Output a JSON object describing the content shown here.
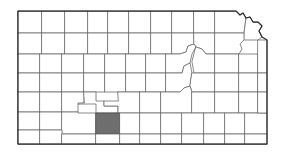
{
  "figure": {
    "kind": "choropleth-locator-map",
    "state": "Kansas",
    "background_color": "#ffffff",
    "county_fill_color": "#ffffff",
    "county_border_color": "#6b6b6b",
    "state_border_color": "#2b2b2b",
    "highlight_fill_color": "#6e6e6e",
    "highlight_border_color": "#4a4a4a",
    "highlighted_county_count": 1,
    "highlighted_county_region": "south-central",
    "caption": ""
  },
  "chart_data": {
    "type": "map",
    "subtitle": "",
    "xlabel": "",
    "ylabel": "",
    "legend": [],
    "grid": false,
    "projection": "plate-carree-approx",
    "viewbox": [
      0,
      0,
      286,
      156
    ],
    "state_outline_points": "18,11 18,144 267,144 267,40 262,37 259,31 262,26 258,22 253,22 250,17 246,18 243,13 240,15 236,11 18,11",
    "highlighted_feature": {
      "name": "highlighted-county",
      "value": 1,
      "fill": "#6e6e6e",
      "bbox": [
        96,
        113,
        24,
        21
      ]
    },
    "unhighlighted_value": 0,
    "counties": [
      {
        "id": "c-r1-01",
        "hl": false,
        "d": "M18,11 L42,11 L42,33 L18,33 Z"
      },
      {
        "id": "c-r1-02",
        "hl": false,
        "d": "M42,11 L65,11 L65,33 L42,33 Z"
      },
      {
        "id": "c-r1-03",
        "hl": false,
        "d": "M65,11 L88,11 L88,33 L65,33 Z"
      },
      {
        "id": "c-r1-04",
        "hl": false,
        "d": "M88,11 L108,11 L108,33 L88,33 Z"
      },
      {
        "id": "c-r1-05",
        "hl": false,
        "d": "M108,11 L129,11 L129,33 L108,33 Z"
      },
      {
        "id": "c-r1-06",
        "hl": false,
        "d": "M129,11 L151,11 L151,33 L129,33 Z"
      },
      {
        "id": "c-r1-07",
        "hl": false,
        "d": "M151,11 L172,11 L172,33 L151,33 Z"
      },
      {
        "id": "c-r1-08",
        "hl": false,
        "d": "M172,11 L194,11 L194,33 L172,33 Z"
      },
      {
        "id": "c-r1-09",
        "hl": false,
        "d": "M194,11 L215,11 L215,33 L194,33 Z"
      },
      {
        "id": "c-r1-10",
        "hl": false,
        "d": "M215,11 L236,11 L240,15 L243,13 L246,18 L244,33 L215,33 Z"
      },
      {
        "id": "c-r1-11",
        "hl": false,
        "d": "M244,33 L246,18 L250,17 L253,22 L258,22 L262,26 L259,31 L262,37 L258,40 L244,40 Z"
      },
      {
        "id": "c-r2-01",
        "hl": false,
        "d": "M18,33 L42,33 L42,54 L18,54 Z"
      },
      {
        "id": "c-r2-02",
        "hl": false,
        "d": "M42,33 L65,33 L65,54 L42,54 Z"
      },
      {
        "id": "c-r2-03",
        "hl": false,
        "d": "M65,33 L88,33 L88,54 L65,54 Z"
      },
      {
        "id": "c-r2-04",
        "hl": false,
        "d": "M88,33 L108,33 L108,54 L88,54 Z"
      },
      {
        "id": "c-r2-05",
        "hl": false,
        "d": "M108,33 L129,33 L129,54 L108,54 Z"
      },
      {
        "id": "c-r2-06",
        "hl": false,
        "d": "M129,33 L151,33 L151,54 L129,54 Z"
      },
      {
        "id": "c-r2-07",
        "hl": false,
        "d": "M151,33 L172,33 L172,54 L151,54 Z"
      },
      {
        "id": "c-r2-08",
        "hl": false,
        "d": "M172,33 L194,33 L194,44 L188,46 L186,52 L180,54 L172,54 Z"
      },
      {
        "id": "c-r2-09",
        "hl": false,
        "d": "M194,33 L215,33 L215,54 L206,54 L202,49 L196,47 L194,44 Z"
      },
      {
        "id": "c-r2-10",
        "hl": false,
        "d": "M215,33 L244,33 L244,40 L240,44 L242,49 L239,54 L215,54 Z"
      },
      {
        "id": "c-r3-01",
        "hl": false,
        "d": "M18,54 L40,54 L40,73 L18,73 Z"
      },
      {
        "id": "c-r3-02",
        "hl": false,
        "d": "M40,54 L62,54 L62,73 L40,73 Z"
      },
      {
        "id": "c-r3-03",
        "hl": false,
        "d": "M62,54 L84,54 L84,73 L62,73 Z"
      },
      {
        "id": "c-r3-04",
        "hl": false,
        "d": "M84,54 L105,54 L105,73 L84,73 Z"
      },
      {
        "id": "c-r3-05",
        "hl": false,
        "d": "M105,54 L126,54 L126,73 L105,73 Z"
      },
      {
        "id": "c-r3-06",
        "hl": false,
        "d": "M126,54 L146,54 L146,73 L126,73 Z"
      },
      {
        "id": "c-r3-07",
        "hl": false,
        "d": "M146,54 L166,54 L166,73 L146,73 Z"
      },
      {
        "id": "c-r3-08",
        "hl": false,
        "d": "M166,54 L180,54 L186,52 L188,46 L194,44 L196,47 L192,54 L190,63 L184,66 L182,73 L166,73 Z"
      },
      {
        "id": "c-r3-09",
        "hl": false,
        "d": "M196,47 L202,49 L206,54 L215,54 L215,73 L194,73 L192,62 Z"
      },
      {
        "id": "c-r3-10",
        "hl": false,
        "d": "M215,54 L239,54 L239,73 L215,73 Z"
      },
      {
        "id": "c-r3-11",
        "hl": false,
        "d": "M239,54 L258,54 L258,73 L239,73 Z"
      },
      {
        "id": "c-r4-01",
        "hl": false,
        "d": "M18,73 L40,73 L40,92 L18,92 Z"
      },
      {
        "id": "c-r4-02",
        "hl": false,
        "d": "M40,73 L62,73 L62,92 L40,92 Z"
      },
      {
        "id": "c-r4-03",
        "hl": false,
        "d": "M62,73 L84,73 L84,92 L62,92 Z"
      },
      {
        "id": "c-r4-04",
        "hl": false,
        "d": "M84,73 L105,73 L105,92 L84,92 Z"
      },
      {
        "id": "c-r4-05",
        "hl": false,
        "d": "M105,73 L126,73 L126,92 L105,92 Z"
      },
      {
        "id": "c-r4-06",
        "hl": false,
        "d": "M126,73 L146,73 L146,92 L126,92 Z"
      },
      {
        "id": "c-r4-07",
        "hl": false,
        "d": "M146,73 L166,73 L166,92 L146,92 Z"
      },
      {
        "id": "c-r4-08",
        "hl": false,
        "d": "M166,73 L182,73 L184,66 L190,63 L192,73 L190,86 L184,88 L180,92 L166,92 Z"
      },
      {
        "id": "c-r4-09",
        "hl": false,
        "d": "M192,73 L215,73 L215,92 L192,92 L190,86 Z"
      },
      {
        "id": "c-r4-10",
        "hl": false,
        "d": "M215,73 L239,73 L239,92 L215,92 Z"
      },
      {
        "id": "c-r4-11",
        "hl": false,
        "d": "M239,73 L258,73 L258,92 L239,92 Z"
      },
      {
        "id": "c-r5-01",
        "hl": false,
        "d": "M18,92 L40,92 L40,112 L18,112 Z"
      },
      {
        "id": "c-r5-02",
        "hl": false,
        "d": "M40,92 L62,92 L62,112 L40,112 Z"
      },
      {
        "id": "c-r5-03",
        "hl": false,
        "d": "M62,92 L84,92 L84,103 L78,104 L78,112 L62,112 Z"
      },
      {
        "id": "c-r5-04",
        "hl": false,
        "d": "M84,92 L96,92 L96,101 L104,101 L104,106 L118,106 L118,113 L96,113 L96,104 L78,104 L78,103 L84,103 Z"
      },
      {
        "id": "c-r5-05",
        "hl": false,
        "d": "M118,92 L140,92 L140,113 L118,113 L118,106 L104,106 L104,101 L118,101 Z"
      },
      {
        "id": "c-r5-06",
        "hl": false,
        "d": "M140,92 L161,92 L161,113 L140,113 Z"
      },
      {
        "id": "c-r5-07",
        "hl": false,
        "d": "M161,92 L180,92 L184,88 L190,86 L192,92 L192,113 L161,113 Z"
      },
      {
        "id": "c-r5-08",
        "hl": false,
        "d": "M192,92 L215,92 L215,113 L192,113 Z"
      },
      {
        "id": "c-r5-09",
        "hl": false,
        "d": "M215,92 L239,92 L239,113 L215,113 Z"
      },
      {
        "id": "c-r5-10",
        "hl": false,
        "d": "M239,92 L258,92 L258,113 L239,113 Z"
      },
      {
        "id": "c-r6-01",
        "hl": false,
        "d": "M18,112 L40,112 L40,130 L18,130 Z"
      },
      {
        "id": "c-r6-02",
        "hl": false,
        "d": "M40,112 L62,112 L62,130 L40,130 Z"
      },
      {
        "id": "c-r6-03",
        "hl": false,
        "d": "M62,112 L78,112 L78,113 L96,113 L96,134 L62,134 Z"
      },
      {
        "id": "c-r6-04",
        "hl": true,
        "d": "M96,113 L120,113 L120,134 L96,134 Z"
      },
      {
        "id": "c-r6-05",
        "hl": false,
        "d": "M120,113 L140,113 L140,134 L120,134 Z"
      },
      {
        "id": "c-r6-06",
        "hl": false,
        "d": "M140,113 L161,113 L161,134 L140,134 Z"
      },
      {
        "id": "c-r6-07",
        "hl": false,
        "d": "M161,113 L182,113 L182,134 L161,134 Z"
      },
      {
        "id": "c-r6-08",
        "hl": false,
        "d": "M182,113 L204,113 L204,134 L182,134 Z"
      },
      {
        "id": "c-r6-09",
        "hl": false,
        "d": "M204,113 L225,113 L225,134 L204,134 Z"
      },
      {
        "id": "c-r6-10",
        "hl": false,
        "d": "M225,113 L245,113 L245,134 L225,134 Z"
      },
      {
        "id": "c-r6-11",
        "hl": false,
        "d": "M245,113 L267,113 L267,134 L245,134 Z"
      },
      {
        "id": "c-r7-01",
        "hl": false,
        "d": "M18,130 L40,130 L40,144 L18,144 Z"
      },
      {
        "id": "c-r7-02",
        "hl": false,
        "d": "M40,130 L62,130 L62,144 L40,144 Z"
      },
      {
        "id": "c-r7-03",
        "hl": false,
        "d": "M62,134 L96,134 L96,144 L62,144 Z"
      },
      {
        "id": "c-r7-04",
        "hl": false,
        "d": "M96,134 L120,134 L120,144 L96,144 Z"
      },
      {
        "id": "c-r7-05",
        "hl": false,
        "d": "M120,134 L140,134 L140,144 L120,144 Z"
      },
      {
        "id": "c-r7-06",
        "hl": false,
        "d": "M140,134 L161,134 L161,144 L140,144 Z"
      },
      {
        "id": "c-r7-07",
        "hl": false,
        "d": "M161,134 L182,134 L182,144 L161,144 Z"
      },
      {
        "id": "c-r7-08",
        "hl": false,
        "d": "M182,134 L204,134 L204,144 L182,144 Z"
      },
      {
        "id": "c-r7-09",
        "hl": false,
        "d": "M204,134 L225,134 L225,144 L204,144 Z"
      },
      {
        "id": "c-r7-10",
        "hl": false,
        "d": "M225,134 L245,134 L245,144 L225,144 Z"
      },
      {
        "id": "c-r7-11",
        "hl": false,
        "d": "M245,134 L267,134 L267,144 L245,144 Z"
      },
      {
        "id": "c-e-01",
        "hl": false,
        "d": "M258,40 L267,40 L267,73 L258,73 Z"
      },
      {
        "id": "c-e-02",
        "hl": false,
        "d": "M258,73 L267,73 L267,92 L258,92 Z"
      },
      {
        "id": "c-e-03",
        "hl": false,
        "d": "M258,92 L267,92 L267,113 L258,113 Z"
      }
    ]
  }
}
